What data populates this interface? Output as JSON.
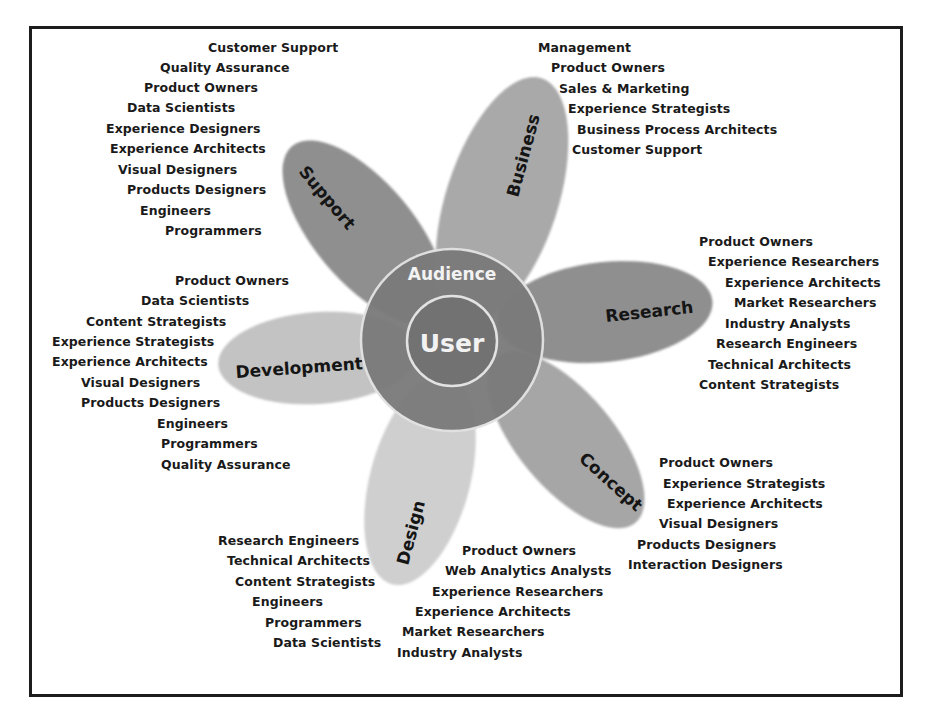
{
  "diagram": {
    "center": {
      "inner_label": "User",
      "outer_label": "Audience"
    },
    "colors": {
      "frame": "#1c1c1c",
      "outer_ring": "#7a7a7a",
      "inner_circle": "#727272",
      "ring_stroke": "#dcdcdc",
      "petal_dark": "#8e8e8e",
      "petal_medium": "#a6a6a6",
      "petal_light": "#c2c2c2",
      "petal_lightest": "#cfcfcf",
      "text": "#1a1a1a"
    },
    "petals": [
      {
        "name": "Business",
        "roles": [
          "Management",
          "Product Owners",
          "Sales & Marketing",
          "Experience Strategists",
          "Business Process Architects",
          "Customer Support"
        ]
      },
      {
        "name": "Research",
        "roles": [
          "Product Owners",
          "Experience Researchers",
          "Experience Architects",
          "Market Researchers",
          "Industry Analysts",
          "Research Engineers",
          "Technical Architects",
          "Content Strategists"
        ]
      },
      {
        "name": "Concept",
        "roles": [
          "Product Owners",
          "Experience Strategists",
          "Experience Architects",
          "Visual Designers",
          "Products Designers",
          "Interaction Designers"
        ]
      },
      {
        "name": "Design",
        "roles_right": [
          "Product Owners",
          "Web Analytics Analysts",
          "Experience Researchers",
          "Experience Architects",
          "Market Researchers",
          "Industry Analysts"
        ],
        "roles_left": [
          "Research Engineers",
          "Technical Architects",
          "Content Strategists",
          "Engineers",
          "Programmers",
          "Data Scientists"
        ]
      },
      {
        "name": "Development",
        "roles": [
          "Product Owners",
          "Data Scientists",
          "Content Strategists",
          "Experience Strategists",
          "Experience Architects",
          "Visual Designers",
          "Products Designers",
          "Engineers",
          "Programmers",
          "Quality Assurance"
        ]
      },
      {
        "name": "Support",
        "roles": [
          "Customer Support",
          "Quality Assurance",
          "Product Owners",
          "Data Scientists",
          "Experience Designers",
          "Experience Architects",
          "Visual Designers",
          "Products Designers",
          "Engineers",
          "Programmers"
        ]
      }
    ]
  }
}
